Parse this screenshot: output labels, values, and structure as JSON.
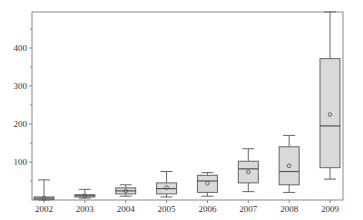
{
  "chart_data": {
    "type": "boxplot",
    "title": "",
    "xlabel": "",
    "ylabel": "",
    "categories": [
      "2002",
      "2003",
      "2004",
      "2005",
      "2006",
      "2007",
      "2008",
      "2009"
    ],
    "yticks": [
      100,
      200,
      300,
      400
    ],
    "ylim": [
      0,
      495
    ],
    "grid": false,
    "legend": null,
    "box_fill": "#d9d9d9",
    "box_stroke": "#666666",
    "series": [
      {
        "category": "2002",
        "min": 0,
        "q1": 1,
        "median": 5,
        "q3": 8,
        "max": 53,
        "mean": 5
      },
      {
        "category": "2003",
        "min": 5,
        "q1": 8,
        "median": 11,
        "q3": 14,
        "max": 28,
        "mean": 11
      },
      {
        "category": "2004",
        "min": 10,
        "q1": 16,
        "median": 24,
        "q3": 32,
        "max": 40,
        "mean": 24
      },
      {
        "category": "2005",
        "min": 8,
        "q1": 16,
        "median": 30,
        "q3": 45,
        "max": 75,
        "mean": 33
      },
      {
        "category": "2006",
        "min": 10,
        "q1": 20,
        "median": 50,
        "q3": 65,
        "max": 72,
        "mean": 44
      },
      {
        "category": "2007",
        "min": 22,
        "q1": 45,
        "median": 82,
        "q3": 102,
        "max": 135,
        "mean": 74
      },
      {
        "category": "2008",
        "min": 20,
        "q1": 40,
        "median": 75,
        "q3": 140,
        "max": 170,
        "mean": 90
      },
      {
        "category": "2009",
        "min": 55,
        "q1": 85,
        "median": 195,
        "q3": 372,
        "max": 495,
        "mean": 225
      }
    ]
  }
}
